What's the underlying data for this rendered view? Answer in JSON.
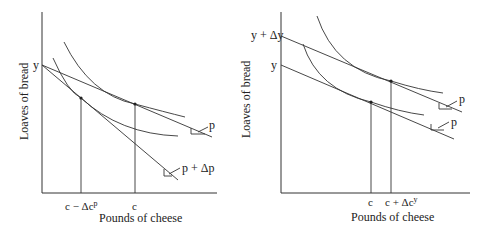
{
  "panels": [
    {
      "id": "left",
      "y_axis_label": "Loaves of bread",
      "x_axis_label": "Pounds of cheese",
      "y_tick": "y",
      "x_ticks": [
        "c − Δcᵖ",
        "c"
      ],
      "budget_labels": [
        "p",
        "p + Δp"
      ],
      "description": "Price increase: budget line pivots around y intercept, consumption falls from c to c - Δc^p"
    },
    {
      "id": "right",
      "y_axis_label": "Loaves of bread",
      "x_axis_label": "Pounds of cheese",
      "y_ticks": [
        "y + Δy",
        "y"
      ],
      "x_ticks": [
        "c",
        "c + Δcʸ"
      ],
      "budget_labels": [
        "p",
        "p"
      ],
      "description": "Income increase: budget line shifts out parallel, consumption rises from c to c + Δc^y"
    }
  ]
}
